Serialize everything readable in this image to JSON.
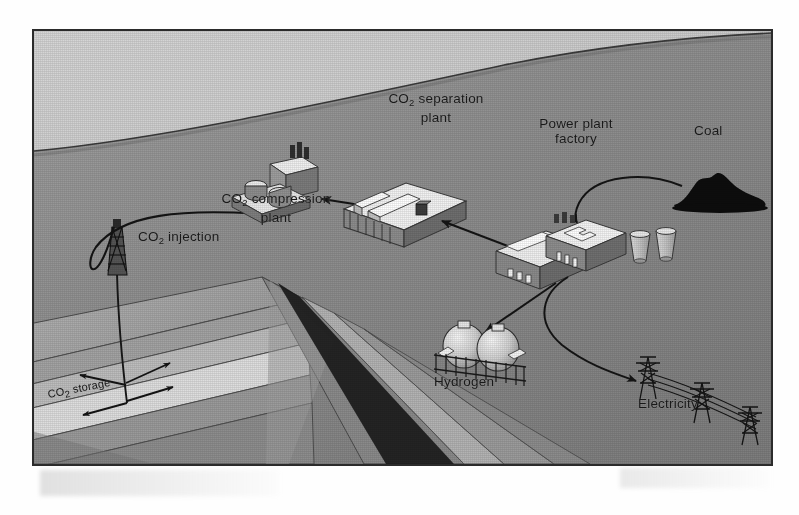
{
  "figure": {
    "kind": "carbon-capture-and-storage-schematic",
    "frame": {
      "border_color": "#2b2b2b",
      "page_background": "#ffffff"
    },
    "palette": {
      "sky": "#c9c9c9",
      "ground": "#8f8f8f",
      "ground_dark": "#7e7e7e",
      "strata_light": "#d9d9d9",
      "strata_mid": "#a8a8a8",
      "strata_dark": "#8a8a8a",
      "shadow": "#6a6a6a",
      "ink": "#1a1a1a",
      "coal": "#0d0d0d",
      "building_light": "#f2f2f2",
      "building_mid": "#b9b9b9",
      "building_dark": "#6f6f6f"
    }
  },
  "labels": {
    "co2_separation_plant": {
      "line1": "CO",
      "sub": "2",
      "line1b": " separation",
      "line2": "plant"
    },
    "co2_compression_plant": {
      "line1": "CO",
      "sub": "2",
      "line1b": " compression",
      "line2": "plant"
    },
    "power_plant_factory": {
      "line1": "Power plant",
      "line2": "factory"
    },
    "coal": {
      "text": "Coal"
    },
    "hydrogen": {
      "text": "Hydrogen"
    },
    "electricity": {
      "text": "Electricity"
    },
    "co2_injection": {
      "line1": "CO",
      "sub": "2",
      "line1b": " injection"
    },
    "co2_storage": {
      "line1": "CO",
      "sub": "2",
      "line1b": " storage"
    }
  },
  "nodes": [
    {
      "name": "coal-pile",
      "label": "Coal"
    },
    {
      "name": "power-plant-factory",
      "label": "Power plant factory"
    },
    {
      "name": "co2-separation-plant",
      "label": "CO2 separation plant"
    },
    {
      "name": "co2-compression-plant",
      "label": "CO2 compression plant"
    },
    {
      "name": "co2-injection-rig",
      "label": "CO2 injection"
    },
    {
      "name": "co2-storage-layer",
      "label": "CO2 storage"
    },
    {
      "name": "hydrogen-tanks",
      "label": "Hydrogen"
    },
    {
      "name": "electricity-pylons",
      "label": "Electricity"
    }
  ],
  "flows": [
    {
      "name": "coal-to-power-plant",
      "from": "Coal",
      "to": "Power plant factory",
      "style": "curved-arrow"
    },
    {
      "name": "power-plant-to-separation",
      "from": "Power plant factory",
      "to": "CO2 separation plant",
      "style": "straight-arrow"
    },
    {
      "name": "separation-to-compression",
      "from": "CO2 separation plant",
      "to": "CO2 compression plant",
      "style": "straight-arrow"
    },
    {
      "name": "compression-to-injection",
      "from": "CO2 compression plant",
      "to": "CO2 injection",
      "style": "curved-pipeline"
    },
    {
      "name": "injection-to-storage",
      "from": "CO2 injection",
      "to": "CO2 storage",
      "style": "well-bore"
    },
    {
      "name": "power-plant-to-hydrogen",
      "from": "Power plant factory",
      "to": "Hydrogen",
      "style": "straight-arrow"
    },
    {
      "name": "power-plant-to-electricity",
      "from": "Power plant factory",
      "to": "Electricity",
      "style": "curved-arrow"
    },
    {
      "name": "storage-spread",
      "from": "CO2 storage",
      "to": "reservoir",
      "style": "spreading-arrows"
    }
  ]
}
